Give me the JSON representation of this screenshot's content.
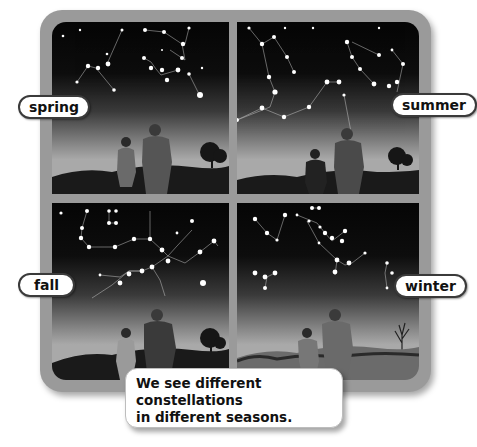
{
  "figure": {
    "panels": [
      {
        "id": "spring",
        "label": "spring"
      },
      {
        "id": "summer",
        "label": "summer"
      },
      {
        "id": "fall",
        "label": "fall"
      },
      {
        "id": "winter",
        "label": "winter"
      }
    ],
    "caption": {
      "line1": "We see different constellations",
      "line2": "in different seasons."
    }
  },
  "colors": {
    "frame": "#9a9a9a",
    "sky_top": "#050505",
    "label_border": "#3a3a3a"
  }
}
